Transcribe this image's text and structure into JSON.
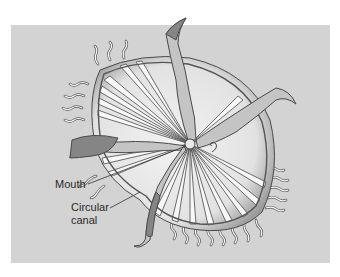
{
  "figure": {
    "background_color": "#d3d3d3",
    "labels": [
      {
        "id": "mouth",
        "text": "Mouth"
      },
      {
        "id": "circular-canal",
        "lines": [
          "Circular",
          "canal"
        ]
      }
    ]
  },
  "colors": {
    "bell_fill": "#e6e6e6",
    "bell_rim": "#b5b5b5",
    "outline": "#4a4a4a",
    "canal_fill": "#f7f7f7",
    "arm_fill": "#c4c4c4",
    "arm_dark": "#858585",
    "tentacle": "#ffffff"
  }
}
